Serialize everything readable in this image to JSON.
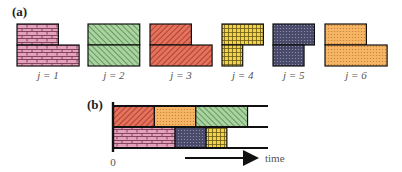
{
  "panels": {
    "a": {
      "label": "(a)"
    },
    "b": {
      "label": "(b)"
    }
  },
  "jobs": [
    {
      "id": 1,
      "label": "j = 1",
      "pattern": "brick",
      "color": "#e3a1bc",
      "stroke": "#7a3a55",
      "shape": "L-right",
      "top_w": 2,
      "bottom_w": 3
    },
    {
      "id": 2,
      "label": "j = 2",
      "pattern": "diag-right",
      "color": "#a9d4a0",
      "stroke": "#3a6e36",
      "shape": "rect",
      "top_w": 2.5,
      "bottom_w": 2.5
    },
    {
      "id": 3,
      "label": "j = 3",
      "pattern": "diag-left",
      "color": "#e8715c",
      "stroke": "#7a2a1e",
      "shape": "L-right",
      "top_w": 2,
      "bottom_w": 3
    },
    {
      "id": 4,
      "label": "j = 4",
      "pattern": "grid",
      "color": "#f2d14d",
      "stroke": "#6b5a10",
      "shape": "L-left",
      "top_w": 2,
      "bottom_w": 1
    },
    {
      "id": 5,
      "label": "j = 5",
      "pattern": "dots",
      "color": "#4a4a6a",
      "stroke": "#111122",
      "shape": "L-left",
      "top_w": 2,
      "bottom_w": 1.5
    },
    {
      "id": 6,
      "label": "j = 6",
      "pattern": "dots-light",
      "color": "#f5b565",
      "stroke": "#8a5a1a",
      "shape": "L-right",
      "top_w": 2,
      "bottom_w": 3
    }
  ],
  "schedule": {
    "rows": [
      [
        {
          "job": 3,
          "start": 0,
          "end": 2
        },
        {
          "job": 6,
          "start": 2,
          "end": 4
        },
        {
          "job": 2,
          "start": 4,
          "end": 6.5
        }
      ],
      [
        {
          "job": 1,
          "start": 0,
          "end": 3
        },
        {
          "job": 5,
          "start": 3,
          "end": 4.5
        },
        {
          "job": 4,
          "start": 4.5,
          "end": 5.5
        }
      ]
    ],
    "axis_end": 7.5,
    "origin_label": "0",
    "time_label": "time"
  }
}
